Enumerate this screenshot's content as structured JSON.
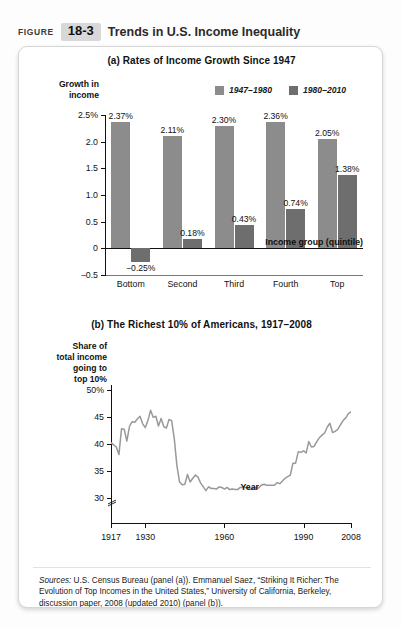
{
  "header": {
    "figure_word": "FIGURE",
    "figure_number": "18-3",
    "title": "Trends in U.S. Income Inequality",
    "badge_color": "#d8d8d8"
  },
  "colors": {
    "series_1947_1980": "#8c8c8c",
    "series_1980_2010": "#6e6e6e",
    "line_color": "#999999",
    "axis_color": "#111111",
    "card_border": "#d6d6d6"
  },
  "sources": {
    "label": "Sources:",
    "text": " U.S. Census Bureau (panel (a)). Emmanuel Saez, “Striking It Richer: The Evolution of Top Incomes in the United States,” University of California, Berkeley, discussion paper, 2008 (updated 2010) (panel (b))."
  },
  "chart_data": [
    {
      "id": "panel_a",
      "type": "bar",
      "title": "(a) Rates of Income Growth Since 1947",
      "ylabel": "Growth in income",
      "xlabel": "Income group (quintile)",
      "categories": [
        "Bottom",
        "Second",
        "Third",
        "Fourth",
        "Top"
      ],
      "series": [
        {
          "name": "1947–1980",
          "color": "#8c8c8c",
          "values": [
            2.37,
            2.11,
            2.3,
            2.36,
            2.05
          ],
          "labels": [
            "2.37%",
            "2.11%",
            "2.30%",
            "2.36%",
            "2.05%"
          ]
        },
        {
          "name": "1980–2010",
          "color": "#6e6e6e",
          "values": [
            -0.25,
            0.18,
            0.43,
            0.74,
            1.38
          ],
          "labels": [
            "−0.25%",
            "0.18%",
            "0.43%",
            "0.74%",
            "1.38%"
          ]
        }
      ],
      "yticks": [
        2.5,
        2.0,
        1.5,
        1.0,
        0.5,
        0,
        -0.5
      ],
      "ytick_labels": [
        "2.5%",
        "2.0",
        "1.5",
        "1.0",
        "0.5",
        "0",
        "−0.5"
      ],
      "ylim": [
        -0.5,
        2.5
      ],
      "grid": false,
      "legend_position": "top-right"
    },
    {
      "id": "panel_b",
      "type": "line",
      "title": "(b) The Richest 10% of Americans, 1917–2008",
      "ylabel": "Share of total income going to top 10%",
      "xlabel": "Year",
      "yticks": [
        50,
        45,
        40,
        35,
        30
      ],
      "ytick_labels": [
        "50%",
        "45",
        "40",
        "35",
        "30"
      ],
      "ylim": [
        28,
        51
      ],
      "xticks": [
        1917,
        1930,
        1960,
        1990,
        2008
      ],
      "xtick_labels": [
        "1917",
        "1930",
        "1960",
        "1990",
        "2008"
      ],
      "xlim": [
        1917,
        2008
      ],
      "axis_break": true,
      "grid": false,
      "x": [
        1917,
        1918,
        1919,
        1920,
        1921,
        1922,
        1923,
        1924,
        1925,
        1926,
        1927,
        1928,
        1929,
        1930,
        1931,
        1932,
        1933,
        1934,
        1935,
        1936,
        1937,
        1938,
        1939,
        1940,
        1941,
        1942,
        1943,
        1944,
        1945,
        1946,
        1947,
        1948,
        1949,
        1950,
        1951,
        1952,
        1953,
        1954,
        1955,
        1956,
        1957,
        1958,
        1959,
        1960,
        1961,
        1962,
        1963,
        1964,
        1965,
        1966,
        1967,
        1968,
        1969,
        1970,
        1971,
        1972,
        1973,
        1974,
        1975,
        1976,
        1977,
        1978,
        1979,
        1980,
        1981,
        1982,
        1983,
        1984,
        1985,
        1986,
        1987,
        1988,
        1989,
        1990,
        1991,
        1992,
        1993,
        1994,
        1995,
        1996,
        1997,
        1998,
        1999,
        2000,
        2001,
        2002,
        2003,
        2004,
        2005,
        2006,
        2007,
        2008
      ],
      "y": [
        40.3,
        39.9,
        39.5,
        38.1,
        42.9,
        42.8,
        40.6,
        43.3,
        44.2,
        44.1,
        44.7,
        45.2,
        43.8,
        43.1,
        44.4,
        46.3,
        45.0,
        45.2,
        43.4,
        44.8,
        43.3,
        43.0,
        44.6,
        44.4,
        41.0,
        36.0,
        33.0,
        32.5,
        32.6,
        34.4,
        33.0,
        33.7,
        34.3,
        33.9,
        32.8,
        32.1,
        31.4,
        32.1,
        31.8,
        31.8,
        31.7,
        32.1,
        32.0,
        31.7,
        32.0,
        31.6,
        31.7,
        31.6,
        31.6,
        32.0,
        32.0,
        32.0,
        31.8,
        31.6,
        32.0,
        31.9,
        31.9,
        32.4,
        32.6,
        32.4,
        32.4,
        32.4,
        32.4,
        32.9,
        32.7,
        33.2,
        33.7,
        34.0,
        34.3,
        36.5,
        36.5,
        38.6,
        38.5,
        38.8,
        38.4,
        40.5,
        39.5,
        39.6,
        40.5,
        41.2,
        41.7,
        42.1,
        43.2,
        43.9,
        42.2,
        42.4,
        42.8,
        43.6,
        44.4,
        44.9,
        45.7,
        46.0
      ],
      "series_name": "Share of total income going to top 10%"
    }
  ]
}
